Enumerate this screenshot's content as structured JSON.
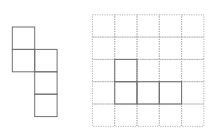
{
  "figure": {
    "width": 210,
    "height": 140,
    "background": "#ffffff",
    "net": {
      "description": "cube-net-like arrangement of 5 unit squares",
      "origin": [
        12.3,
        27
      ],
      "cell": 22.4,
      "stroke": "#707070",
      "cells": [
        [
          0,
          0
        ],
        [
          0,
          1
        ],
        [
          1,
          1
        ],
        [
          1,
          2
        ],
        [
          1,
          3
        ]
      ]
    },
    "grid": {
      "origin": [
        92.4,
        14.8
      ],
      "cell": 22.3,
      "cols": 5,
      "rows": 5,
      "stroke": "#b4b4b4",
      "dash": "1.2 1.2",
      "shape": {
        "stroke": "#707070",
        "cells": [
          [
            1,
            2
          ],
          [
            1,
            3
          ],
          [
            2,
            3
          ],
          [
            3,
            3
          ]
        ]
      }
    }
  }
}
